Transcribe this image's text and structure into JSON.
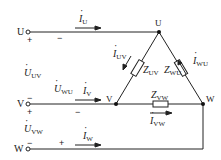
{
  "diagram": {
    "type": "three-phase delta load circuit",
    "terminals": [
      {
        "id": "U",
        "label": "U"
      },
      {
        "id": "V",
        "label": "V"
      },
      {
        "id": "W",
        "label": "W"
      }
    ],
    "nodes": [
      {
        "id": "U",
        "label": "U"
      },
      {
        "id": "V",
        "label": "V"
      },
      {
        "id": "W",
        "label": "W"
      }
    ],
    "line_currents": [
      {
        "symbol": "I",
        "sub": "U"
      },
      {
        "symbol": "I",
        "sub": "V"
      },
      {
        "symbol": "I",
        "sub": "W"
      }
    ],
    "voltages": [
      {
        "symbol": "U",
        "sub": "UV"
      },
      {
        "symbol": "U",
        "sub": "WU"
      },
      {
        "symbol": "U",
        "sub": "VW"
      }
    ],
    "impedances": [
      {
        "symbol": "Z",
        "sub": "UV"
      },
      {
        "symbol": "Z",
        "sub": "WU"
      },
      {
        "symbol": "Z",
        "sub": "VW"
      }
    ],
    "phase_currents": [
      {
        "symbol": "I",
        "sub": "UV"
      },
      {
        "symbol": "I",
        "sub": "WU"
      },
      {
        "symbol": "I",
        "sub": "VW"
      }
    ],
    "signs": {
      "plus": "+",
      "minus": "−"
    }
  }
}
